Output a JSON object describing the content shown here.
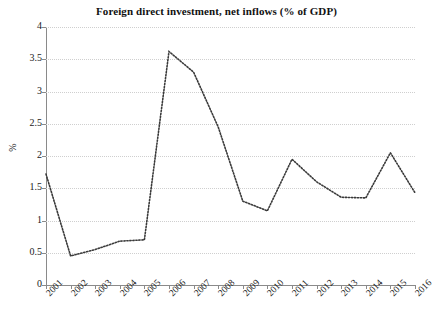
{
  "chart_data": {
    "type": "line",
    "title": "Foreign direct investment, net inflows (% of GDP)",
    "xlabel": "",
    "ylabel": "%",
    "categories": [
      "2001",
      "2002",
      "2003",
      "2004",
      "2005",
      "2006",
      "2007",
      "2008",
      "2009",
      "2010",
      "2011",
      "2012",
      "2013",
      "2014",
      "2015",
      "2016"
    ],
    "values": [
      1.72,
      0.45,
      0.55,
      0.68,
      0.7,
      3.62,
      3.3,
      2.45,
      1.3,
      1.15,
      1.95,
      1.6,
      1.36,
      1.35,
      2.05,
      1.43
    ],
    "series": [
      {
        "name": "Foreign direct investment, net inflows (% of GDP)",
        "values": [
          1.72,
          0.45,
          0.55,
          0.68,
          0.7,
          3.62,
          3.3,
          2.45,
          1.3,
          1.15,
          1.95,
          1.6,
          1.36,
          1.35,
          2.05,
          1.43
        ]
      }
    ],
    "ylim": [
      0,
      4
    ],
    "ytick_labels": [
      "0",
      "0.5",
      "1",
      "1.5",
      "2",
      "2.5",
      "3",
      "3.5",
      "4"
    ],
    "ytick_values": [
      0,
      0.5,
      1,
      1.5,
      2,
      2.5,
      3,
      3.5,
      4
    ],
    "grid": true,
    "grid_style": "dotted",
    "line_style": "dotted",
    "legend": "none",
    "colors": {
      "series_line": "#3a3a3a",
      "gridline": "#cfcfcf",
      "axis": "#8a8a8a",
      "text": "#1a1a1a",
      "background": "#ffffff"
    }
  }
}
